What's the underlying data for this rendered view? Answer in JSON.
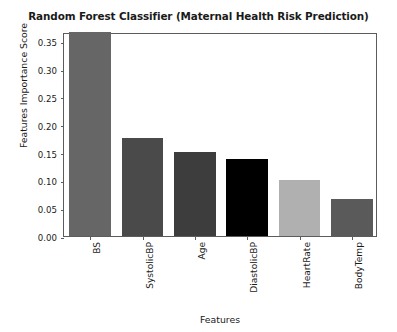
{
  "chart_data": {
    "type": "bar",
    "title": "Random Forest Classifier (Maternal Health Risk Prediction)",
    "xlabel": "Features",
    "ylabel": "Features Importance Score",
    "categories": [
      "BS",
      "SystolicBP",
      "Age",
      "DiastolicBP",
      "HeartRate",
      "BodyTemp"
    ],
    "values": [
      0.366,
      0.176,
      0.151,
      0.138,
      0.101,
      0.067
    ],
    "colors": [
      "#666666",
      "#4a4a4a",
      "#3d3d3d",
      "#000000",
      "#b0b0b0",
      "#5a5a5a"
    ],
    "ylim": [
      0.0,
      0.3665
    ],
    "yticks": [
      0.0,
      0.05,
      0.1,
      0.15,
      0.2,
      0.25,
      0.3,
      0.35
    ],
    "ytick_labels": [
      "0.00",
      "0.05",
      "0.10",
      "0.15",
      "0.20",
      "0.25",
      "0.30",
      "0.35"
    ],
    "grid": false,
    "legend": "none"
  }
}
